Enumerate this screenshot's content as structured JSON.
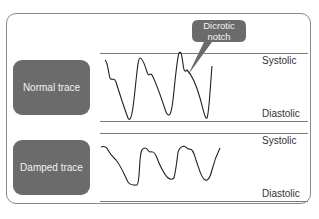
{
  "diagram": {
    "panels": [
      {
        "label": "Normal trace",
        "top_label": "Systolic",
        "bottom_label": "Diastolic"
      },
      {
        "label": "Damped trace",
        "top_label": "Systolic",
        "bottom_label": "Diastolic"
      }
    ],
    "callout": {
      "line1": "Dicrotic",
      "line2": "notch"
    },
    "colors": {
      "box": "#6b6b6b",
      "box_text": "#f2f2f2",
      "line": "#7a7a7a",
      "trace": "#222222",
      "label": "#333333"
    }
  }
}
